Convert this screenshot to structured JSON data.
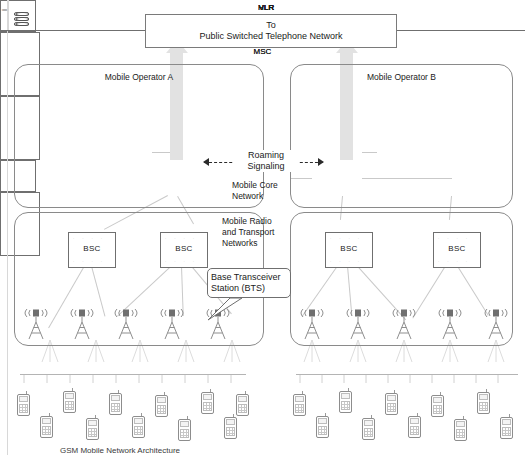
{
  "diagram": {
    "title_caption": "GSM Mobile Network Architecture",
    "pstn": {
      "line1": "To",
      "line2": "Public Switched Telephone Network"
    },
    "operators": [
      {
        "id": "A",
        "title": "Mobile Operator A"
      },
      {
        "id": "B",
        "title": "Mobile Operator B"
      }
    ],
    "zone_labels": {
      "core": "Mobile Core\nNetwork",
      "core_line1": "Mobile Core",
      "core_line2": "Network",
      "radio_line1": "Mobile Radio",
      "radio_line2": "and Transport",
      "radio_line3": "Networks"
    },
    "roaming": {
      "line1": "Roaming",
      "line2": "Signaling"
    },
    "callout": {
      "line1": "Base Transceiver",
      "line2": "Station (BTS)"
    },
    "nodes": {
      "hlr": "HLR",
      "vlr": "VLR",
      "gmsc": "GMSC",
      "msc": "MSC",
      "bsc": "BSC"
    },
    "core_nodes_a": [
      {
        "name": "hlr-node",
        "top_label": "HLR",
        "bottom_label": ""
      },
      {
        "name": "vlr-gmsc-msc-node",
        "top_label": "VLR",
        "bottom_label": "GMSC",
        "bottom_label2": "MSC"
      }
    ],
    "core_nodes_b": [
      {
        "name": "vlr-gmsc-msc-node",
        "top_label": "VLR",
        "bottom_label": "GMSC",
        "bottom_label2": "MSC"
      },
      {
        "name": "hlr-node",
        "top_label": "HLR",
        "bottom_label": ""
      },
      {
        "name": "vlr-msc-node",
        "top_label": "VLR",
        "bottom_label": "MSC"
      }
    ],
    "bsc_labels": [
      "BSC",
      "BSC",
      "BSC",
      "BSC"
    ],
    "colors": {
      "trunk_gray": "#e2e2e2",
      "line_gray": "#c9c9c9",
      "box_border": "#6f6f6f",
      "zone_border": "#8a8a8a",
      "text": "#1a1a1a"
    },
    "counts": {
      "towers_operator_a": 5,
      "towers_operator_b": 5,
      "bsc_per_operator": 2
    }
  }
}
